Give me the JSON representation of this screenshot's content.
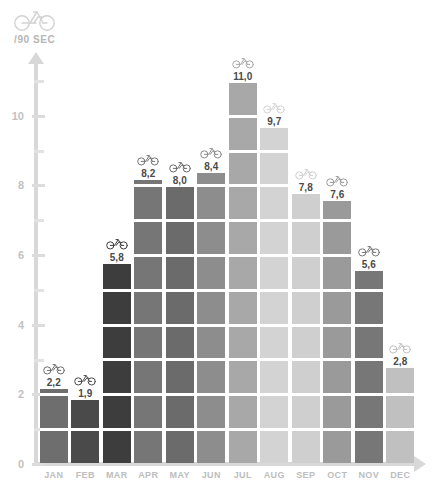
{
  "header": {
    "icon": "bicycle-icon",
    "unit_label": "/90 SEC"
  },
  "axis": {
    "y_tick_labels": [
      "0",
      "2",
      "4",
      "6",
      "8",
      "10"
    ],
    "arrow_y": "arrow-up-icon",
    "arrow_x": "arrow-right-icon"
  },
  "chart_data": {
    "type": "bar",
    "title": "",
    "subtitle": "",
    "xlabel": "",
    "ylabel": "/90 SEC",
    "ylim": [
      0,
      11.6
    ],
    "yticks": [
      0,
      2,
      4,
      6,
      8,
      10
    ],
    "minor_tick_step": 1,
    "grid": false,
    "legend": "none",
    "decimal_separator": ",",
    "segment_unit": 1,
    "categories": [
      "JAN",
      "FEB",
      "MAR",
      "APR",
      "MAY",
      "JUN",
      "JUL",
      "AUG",
      "SEP",
      "OCT",
      "NOV",
      "DEC"
    ],
    "values": [
      2.2,
      1.9,
      5.8,
      8.2,
      8.0,
      8.4,
      11.0,
      9.7,
      7.8,
      7.6,
      5.6,
      2.8
    ],
    "value_labels": [
      "2,2",
      "1,9",
      "5,8",
      "8,2",
      "8,0",
      "8,4",
      "11,0",
      "9,7",
      "7,8",
      "7,6",
      "5,6",
      "2,8"
    ],
    "bar_colors": [
      "#6e6e6e",
      "#4a4a4a",
      "#3d3d3d",
      "#767676",
      "#6b6b6b",
      "#8d8d8d",
      "#a8a8a8",
      "#d3d3d3",
      "#cfcfcf",
      "#9a9a9a",
      "#777777",
      "#c0c0c0"
    ],
    "point_icon": "bicycle-icon"
  },
  "colors": {
    "axis": "#d8d8d8",
    "tick": "#e2e2e2",
    "tick_label": "#c2c2c2",
    "month_label": "#bdbdbd",
    "value_label": "#4a4a4a",
    "background": "#ffffff"
  }
}
